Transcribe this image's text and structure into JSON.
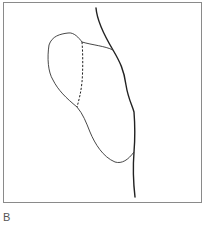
{
  "figure": {
    "panel_label": "B",
    "elements": [
      {
        "name": "thick-boundary-line",
        "style": "solid-thick"
      },
      {
        "name": "lobe-outline",
        "style": "solid-thin"
      },
      {
        "name": "dashed-division-line",
        "style": "dashed"
      }
    ],
    "colors": {
      "frame": "#8a8a8a",
      "line": "#222222",
      "label": "#555555"
    }
  }
}
